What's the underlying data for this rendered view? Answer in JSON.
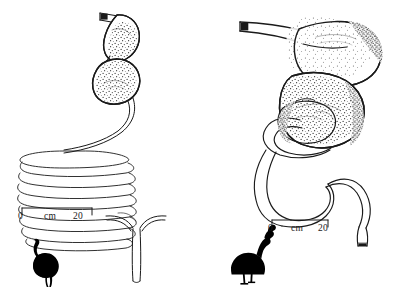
{
  "figure": {
    "background_color": "#ffffff",
    "ink_color": "#1a1a1a",
    "title": ""
  },
  "panels": [
    {
      "id": "emu-panel",
      "species_silhouette": "emu-silhouette",
      "species_label": "Emu",
      "scale_bar": {
        "left_label": "0",
        "unit_label": "cm",
        "right_label": "20",
        "length_cm": 20,
        "bar_x_start": 22,
        "bar_x_end": 92,
        "bar_y": 208
      },
      "parts": [
        {
          "name": "esophagus",
          "label": ""
        },
        {
          "name": "proventriculus",
          "label": ""
        },
        {
          "name": "gizzard",
          "label": ""
        },
        {
          "name": "small-intestine-coil",
          "label": "",
          "coil_count": 9
        },
        {
          "name": "ceca",
          "label": ""
        },
        {
          "name": "rectum",
          "label": ""
        }
      ]
    },
    {
      "id": "cassowary-panel",
      "species_silhouette": "cassowary-silhouette",
      "species_label": "Cassowary",
      "scale_bar": {
        "left_label": "0",
        "unit_label": "cm",
        "right_label": "20",
        "length_cm": 20,
        "bar_x_start": 272,
        "bar_x_end": 328,
        "bar_y": 220
      },
      "parts": [
        {
          "name": "esophagus",
          "label": ""
        },
        {
          "name": "proventriculus",
          "label": ""
        },
        {
          "name": "gizzard",
          "label": ""
        },
        {
          "name": "small-intestine-loops",
          "label": "",
          "loop_count": 3
        },
        {
          "name": "rectum",
          "label": ""
        }
      ]
    }
  ]
}
